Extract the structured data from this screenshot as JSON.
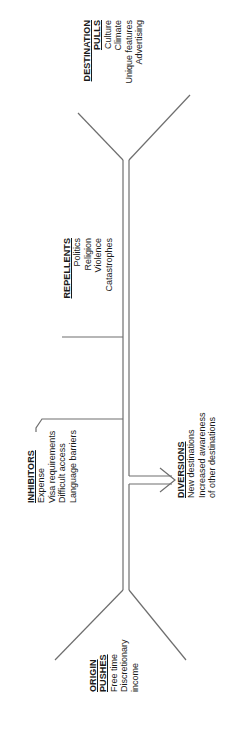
{
  "diagram": {
    "origin": {
      "header": [
        "ORIGIN",
        "PUSHES"
      ],
      "items": [
        "Free time",
        "Discretionary",
        "income"
      ]
    },
    "inhibitors": {
      "header": "INHIBITORS",
      "items": [
        "Expense",
        "Visa requirements",
        "Difficult access",
        "Language barriers"
      ]
    },
    "diversions": {
      "header": "DIVERSIONS",
      "items": [
        "New destinations",
        "Increased awareness",
        "of other destinations"
      ]
    },
    "repellents": {
      "header": "REPELLENTS",
      "items": [
        "Politics",
        "Religion",
        "Violence",
        "Catastrophes"
      ]
    },
    "destination": {
      "header": [
        "DESTINATION",
        "PULLS"
      ],
      "items": [
        "Culture",
        "Climate",
        "Unique features",
        "Advertising"
      ]
    },
    "colors": {
      "line": "#6e6e6e",
      "text": "#1a1a1a",
      "background": "#ffffff"
    }
  }
}
